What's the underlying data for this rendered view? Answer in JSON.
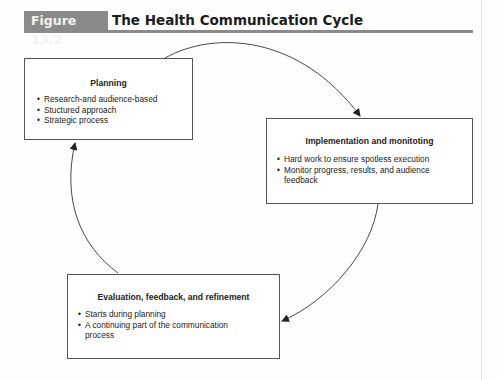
{
  "figure": {
    "label": "Figure 13.2",
    "title": "The Health Communication Cycle",
    "accent_color": "#8a8a8a"
  },
  "boxes": [
    {
      "title": "Planning",
      "bullets": [
        "Research-and audience-based",
        "Stuctured approach",
        "Strategic process"
      ]
    },
    {
      "title": "Implementation and monitoting",
      "bullets": [
        "Hard work to ensure spotless execution",
        "Monitor progress, results, and audience feedback"
      ]
    },
    {
      "title": "Evaluation, feedback, and refinement",
      "bullets": [
        "Starts during planning",
        "A continuing part of the communication process"
      ]
    }
  ],
  "flow": [
    "Planning → Implementation and monitoting",
    "Implementation and monitoting → Evaluation, feedback, and refinement",
    "Evaluation, feedback, and refinement → Planning"
  ]
}
